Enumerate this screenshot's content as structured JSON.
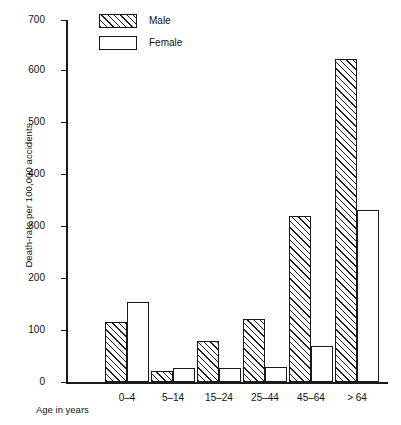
{
  "chart_data": {
    "type": "bar",
    "title": "",
    "categories": [
      "0–4",
      "5–14",
      "15–24",
      "25–44",
      "45–64",
      "> 64"
    ],
    "series": [
      {
        "name": "Male",
        "values": [
          117,
          22,
          80,
          122,
          322,
          625
        ]
      },
      {
        "name": "Female",
        "values": [
          155,
          28,
          28,
          30,
          70,
          333
        ]
      }
    ],
    "xlabel": "Age in years",
    "ylabel": "Death-rate per 100,000 accidents",
    "ylim": [
      0,
      700
    ],
    "ytick_labels": [
      "0",
      "100",
      "200",
      "300",
      "400",
      "500",
      "600",
      "700"
    ],
    "ytick_values": [
      0,
      100,
      200,
      300,
      400,
      500,
      600,
      700
    ],
    "grid": false,
    "legend_position": "top-left-inside",
    "legend": [
      {
        "label": "Male",
        "swatch": "hatched"
      },
      {
        "label": "Female",
        "swatch": "empty"
      }
    ],
    "colors": {
      "axis": "#1a1a1a",
      "bar_outline": "#1a1a1a",
      "male_fill": "hatch-45deg",
      "female_fill": "#ffffff",
      "background": "#ffffff"
    }
  }
}
